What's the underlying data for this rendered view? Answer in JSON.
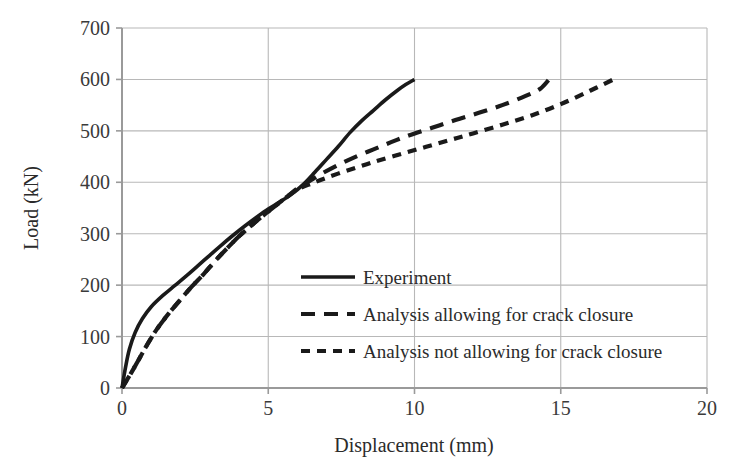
{
  "chart_data": {
    "type": "line",
    "title": "",
    "xlabel": "Displacement (mm)",
    "ylabel": "Load (kN)",
    "xlim": [
      0,
      20
    ],
    "ylim": [
      0,
      700
    ],
    "xticks": [
      "0",
      "5",
      "10",
      "15",
      "20"
    ],
    "yticks": [
      "0",
      "100",
      "200",
      "300",
      "400",
      "500",
      "600",
      "700"
    ],
    "xtick_values": [
      0,
      5,
      10,
      15,
      20
    ],
    "ytick_values": [
      0,
      100,
      200,
      300,
      400,
      500,
      600,
      700
    ],
    "grid": true,
    "grid_color": "#b8b8b8",
    "legend_position": "center-right-inside",
    "series": [
      {
        "name": "Experiment",
        "style": "solid",
        "color": "#1a1a1a",
        "points": [
          [
            0.0,
            0
          ],
          [
            0.12,
            40
          ],
          [
            0.25,
            75
          ],
          [
            0.45,
            108
          ],
          [
            0.7,
            135
          ],
          [
            1.0,
            158
          ],
          [
            1.4,
            180
          ],
          [
            1.8,
            199
          ],
          [
            2.2,
            218
          ],
          [
            2.6,
            238
          ],
          [
            3.0,
            258
          ],
          [
            3.4,
            278
          ],
          [
            3.8,
            297
          ],
          [
            4.2,
            315
          ],
          [
            4.6,
            332
          ],
          [
            5.0,
            348
          ],
          [
            5.4,
            362
          ],
          [
            5.8,
            377
          ],
          [
            6.2,
            396
          ],
          [
            6.6,
            420
          ],
          [
            7.0,
            445
          ],
          [
            7.4,
            470
          ],
          [
            7.8,
            497
          ],
          [
            8.2,
            520
          ],
          [
            8.6,
            540
          ],
          [
            9.0,
            560
          ],
          [
            9.4,
            578
          ],
          [
            9.7,
            590
          ],
          [
            10.0,
            600
          ]
        ]
      },
      {
        "name": "Analysis allowing for crack closure",
        "style": "dashed-long",
        "color": "#1a1a1a",
        "points": [
          [
            0.0,
            0
          ],
          [
            0.3,
            28
          ],
          [
            0.6,
            58
          ],
          [
            0.9,
            88
          ],
          [
            1.2,
            115
          ],
          [
            1.6,
            145
          ],
          [
            2.0,
            172
          ],
          [
            2.4,
            198
          ],
          [
            2.8,
            222
          ],
          [
            3.2,
            248
          ],
          [
            3.6,
            272
          ],
          [
            4.0,
            295
          ],
          [
            4.4,
            315
          ],
          [
            4.8,
            334
          ],
          [
            5.2,
            352
          ],
          [
            5.6,
            370
          ],
          [
            6.0,
            388
          ],
          [
            6.4,
            402
          ],
          [
            6.8,
            416
          ],
          [
            7.4,
            434
          ],
          [
            8.0,
            450
          ],
          [
            8.6,
            464
          ],
          [
            9.2,
            478
          ],
          [
            9.8,
            491
          ],
          [
            10.6,
            506
          ],
          [
            11.4,
            521
          ],
          [
            12.2,
            535
          ],
          [
            13.0,
            550
          ],
          [
            13.8,
            568
          ],
          [
            14.3,
            582
          ],
          [
            14.6,
            600
          ]
        ]
      },
      {
        "name": "Analysis not allowing for crack closure",
        "style": "dashed-short",
        "color": "#1a1a1a",
        "points": [
          [
            0.0,
            0
          ],
          [
            0.3,
            28
          ],
          [
            0.6,
            58
          ],
          [
            0.9,
            88
          ],
          [
            1.2,
            115
          ],
          [
            1.6,
            145
          ],
          [
            2.0,
            172
          ],
          [
            2.4,
            198
          ],
          [
            2.8,
            222
          ],
          [
            3.2,
            248
          ],
          [
            3.6,
            272
          ],
          [
            4.0,
            295
          ],
          [
            4.4,
            315
          ],
          [
            4.8,
            334
          ],
          [
            5.2,
            352
          ],
          [
            5.6,
            370
          ],
          [
            6.0,
            386
          ],
          [
            6.5,
            398
          ],
          [
            7.0,
            409
          ],
          [
            7.6,
            421
          ],
          [
            8.2,
            432
          ],
          [
            8.8,
            443
          ],
          [
            9.6,
            456
          ],
          [
            10.4,
            469
          ],
          [
            11.2,
            482
          ],
          [
            12.0,
            495
          ],
          [
            13.0,
            512
          ],
          [
            14.0,
            530
          ],
          [
            15.0,
            552
          ],
          [
            16.0,
            578
          ],
          [
            16.8,
            600
          ]
        ]
      }
    ],
    "legend": [
      {
        "label": "Experiment",
        "style": "solid"
      },
      {
        "label": "Analysis allowing for crack closure",
        "style": "dashed-long"
      },
      {
        "label": "Analysis not allowing for crack closure",
        "style": "dashed-short"
      }
    ]
  }
}
